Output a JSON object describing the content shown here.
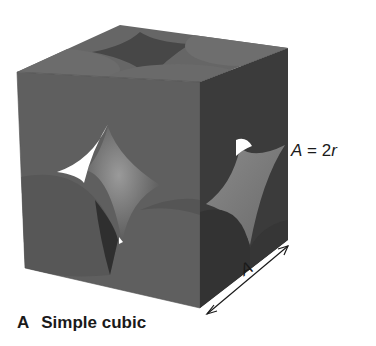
{
  "figure": {
    "panel_letter": "A",
    "caption": "Simple cubic",
    "equation": {
      "lhs": "A",
      "operator": "=",
      "rhs_coefficient": "2",
      "rhs_variable": "r"
    },
    "edge_length_label": "A",
    "colors": {
      "front_face": "#5e5e5e",
      "top_face": "#6a6a6a",
      "right_face": "#3c3c3c",
      "sphere_highlight": "#8c8c8c",
      "void": "#ffffff",
      "text": "#1a1a1a"
    }
  }
}
